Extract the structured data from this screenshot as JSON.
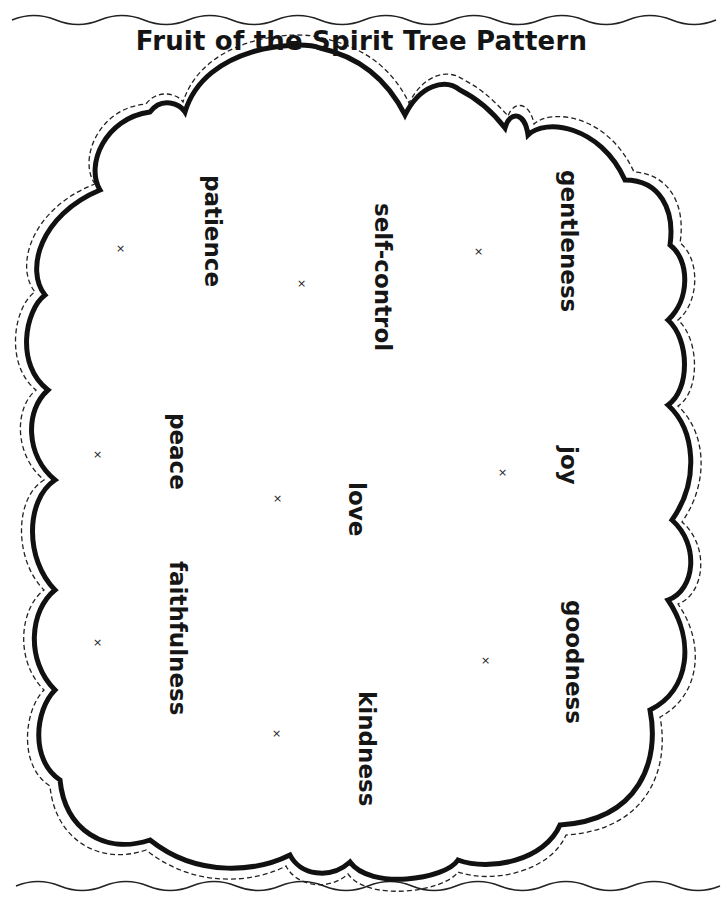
{
  "document": {
    "title": "Fruit of the Spirit Tree Pattern"
  },
  "tree_top": {
    "words": [
      {
        "id": "patience",
        "label": "patience"
      },
      {
        "id": "self-control",
        "label": "self-control"
      },
      {
        "id": "gentleness",
        "label": "gentleness"
      },
      {
        "id": "peace",
        "label": "peace"
      },
      {
        "id": "love",
        "label": "love"
      },
      {
        "id": "joy",
        "label": "joy"
      },
      {
        "id": "faithfulness",
        "label": "faithfulness"
      },
      {
        "id": "kindness",
        "label": "kindness"
      },
      {
        "id": "goodness",
        "label": "goodness"
      }
    ],
    "placement_mark": "×",
    "cut_line_style": "dashed"
  },
  "colors": {
    "ink": "#141414",
    "paper": "#ffffff"
  }
}
